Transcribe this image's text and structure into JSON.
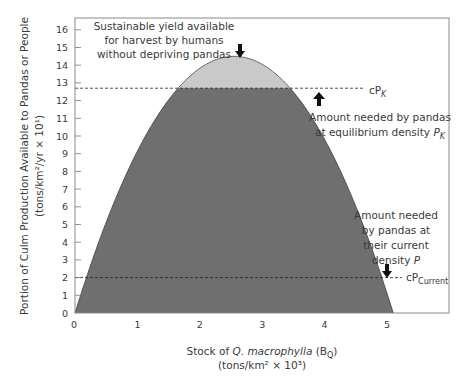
{
  "chart_data": {
    "type": "area",
    "title": "",
    "xlabel": "Stock of Q. macrophylla (B_Q)",
    "xlabel_parts": {
      "prefix": "Stock of ",
      "italic": "Q. macrophylla",
      "suffix": " (B",
      "sub": "Q",
      "close": ")"
    },
    "xlabel_units": "(tons/km² × 10³)",
    "ylabel": "Portion of Culm Production Available to Pandas or People",
    "ylabel_units": "(tons/km²/yr × 10¹)",
    "xlim": [
      0,
      6
    ],
    "ylim": [
      0,
      16.5
    ],
    "x_ticks": [
      0,
      1,
      2,
      3,
      4,
      5
    ],
    "x_tick_labels": [
      "0",
      "1",
      "2",
      "3",
      "4",
      "5"
    ],
    "y_ticks": [
      0,
      1,
      2,
      3,
      4,
      5,
      6,
      7,
      8,
      9,
      10,
      11,
      12,
      13,
      14,
      15,
      16
    ],
    "y_tick_labels": [
      "0",
      "1",
      "2",
      "3",
      "4",
      "5",
      "6",
      "7",
      "8",
      "9",
      "10",
      "11",
      "12",
      "13",
      "14",
      "15",
      "16"
    ],
    "curve": {
      "name": "Culm production",
      "shape": "parabola",
      "x_start": 0,
      "x_end": 5.1,
      "peak_x": 2.6,
      "peak_y": 14.5,
      "fill_below_cPK": "#6f6f6f",
      "fill_above_cPK": "#c9c9c9"
    },
    "reference_lines": [
      {
        "name": "cP_K",
        "y": 12.7,
        "label": "cP",
        "label_sub": "K"
      },
      {
        "name": "cP_Current",
        "y": 2.0,
        "label": "cP",
        "label_sub": "Current"
      }
    ],
    "annotations": [
      {
        "name": "sustainable-yield",
        "lines": [
          "Sustainable yield available",
          "for harvest by humans",
          "without depriving pandas"
        ]
      },
      {
        "name": "amount-equilibrium",
        "lines": [
          "Amount needed by pandas",
          "at equilibrium density "
        ],
        "italic_tail": "P",
        "tail_sub": "K"
      },
      {
        "name": "amount-current",
        "lines": [
          "Amount needed",
          "by pandas at",
          "their current",
          "density "
        ],
        "italic_tail": "P"
      }
    ]
  }
}
